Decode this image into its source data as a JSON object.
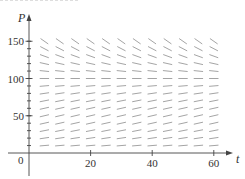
{
  "chart_data": {
    "type": "slope-field",
    "title": "",
    "xlabel": "t",
    "ylabel": "P",
    "xlim": [
      0,
      63
    ],
    "ylim": [
      0,
      155
    ],
    "x_ticks": [
      20,
      40,
      60
    ],
    "y_ticks": [
      50,
      100,
      150
    ],
    "origin_label": "0",
    "grid": false,
    "model": {
      "equation": "dP/dt = k P (1 - P/M)",
      "k": 0.08,
      "M": 100
    },
    "sample_t": [
      5,
      10,
      15,
      20,
      25,
      30,
      35,
      40,
      45,
      50,
      55,
      60
    ],
    "sample_P": [
      10,
      20,
      30,
      40,
      50,
      60,
      70,
      80,
      90,
      100,
      110,
      120,
      130,
      140,
      150
    ],
    "equilibrium_P": 100,
    "segment_color": "#9a9a9a",
    "axis_color": "#444444"
  }
}
